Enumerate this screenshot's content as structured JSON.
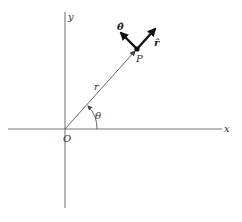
{
  "diagram": {
    "type": "polar-coordinates",
    "colors": {
      "axis": "#777777",
      "vector": "#444444",
      "unit_vector": "#111111",
      "text": "#333333"
    },
    "axes": {
      "x_label": "x",
      "y_label": "y",
      "origin_label": "O"
    },
    "position_vector": {
      "label": "r",
      "point_label": "P",
      "angle_label": "θ"
    },
    "unit_vectors": {
      "radial_label": "r̂",
      "angular_label": "θ̂"
    }
  }
}
